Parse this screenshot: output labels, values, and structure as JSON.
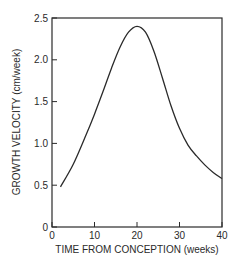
{
  "chart_data": {
    "type": "line",
    "title": "",
    "xlabel": "TIME FROM CONCEPTION (weeks)",
    "ylabel": "GROWTH VELOCITY (cm/week)",
    "xlim": [
      0,
      40
    ],
    "ylim": [
      0,
      2.5
    ],
    "x_ticks": [
      "0",
      "10",
      "20",
      "30",
      "40"
    ],
    "y_ticks": [
      "0",
      "0.5",
      "1.0",
      "1.5",
      "2.0",
      "2.5"
    ],
    "grid": false,
    "legend": null,
    "series": [
      {
        "name": "Growth velocity",
        "x": [
          2,
          5,
          8,
          10,
          12,
          14,
          16,
          18,
          20,
          22,
          24,
          26,
          28,
          30,
          32,
          34,
          36,
          38,
          40
        ],
        "values": [
          0.48,
          0.75,
          1.1,
          1.35,
          1.62,
          1.9,
          2.15,
          2.33,
          2.4,
          2.33,
          2.1,
          1.78,
          1.45,
          1.18,
          0.98,
          0.85,
          0.74,
          0.65,
          0.58
        ]
      }
    ]
  }
}
